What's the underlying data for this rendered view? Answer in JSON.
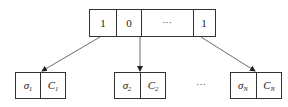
{
  "diagram": {
    "type": "bit-vector-to-pairs",
    "top_array": {
      "cells": [
        "1",
        "0",
        "⋯",
        "1"
      ]
    },
    "bottom_pairs": [
      {
        "sigma": "σ",
        "sigma_sub": "1",
        "c": "C",
        "c_sub": "1"
      },
      {
        "sigma": "σ",
        "sigma_sub": "2",
        "c": "C",
        "c_sub": "2"
      },
      {
        "sigma": "σ",
        "sigma_sub": "N",
        "c": "C",
        "c_sub": "N"
      }
    ],
    "bottom_ellipsis": "⋯",
    "arrows": [
      {
        "from": "top_array.cells.0",
        "to": "bottom_pairs.0"
      },
      {
        "from": "top_array.cells.1",
        "to": "bottom_pairs.1"
      },
      {
        "from": "top_array.cells.3",
        "to": "bottom_pairs.2"
      }
    ],
    "colors": {
      "stroke": "#333333",
      "background": "#ffffff",
      "text": "#222222"
    }
  }
}
